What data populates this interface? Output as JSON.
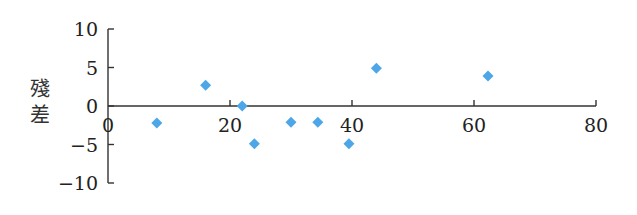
{
  "chart_data": {
    "type": "scatter",
    "title": "",
    "xlabel": "",
    "ylabel": "殘差",
    "xlim": [
      0,
      80
    ],
    "ylim": [
      -10,
      10
    ],
    "x_ticks": [
      0,
      20,
      40,
      60,
      80
    ],
    "y_ticks": [
      10,
      5,
      0,
      -5,
      -10
    ],
    "x_tick_labels": [
      "0",
      "20",
      "40",
      "60",
      "80"
    ],
    "y_tick_labels": [
      "10",
      "5",
      "0",
      "−5",
      "−10"
    ],
    "grid": false,
    "legend": null,
    "marker": "diamond",
    "marker_color": "#4da6e8",
    "series": [
      {
        "name": "殘差",
        "points": [
          {
            "x": 8,
            "y": -2.2
          },
          {
            "x": 16,
            "y": 2.7
          },
          {
            "x": 22,
            "y": 0
          },
          {
            "x": 24,
            "y": -4.9
          },
          {
            "x": 30,
            "y": -2.1
          },
          {
            "x": 34.4,
            "y": -2.1
          },
          {
            "x": 39.5,
            "y": -4.9
          },
          {
            "x": 44,
            "y": 4.9
          },
          {
            "x": 62.3,
            "y": 3.9
          }
        ]
      }
    ]
  }
}
